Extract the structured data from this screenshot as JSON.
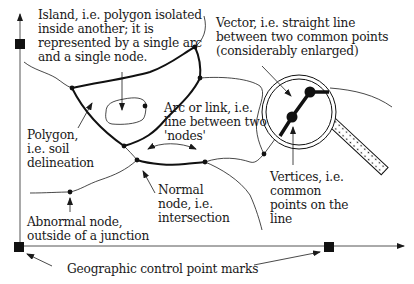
{
  "figure": {
    "labels": {
      "island": "Island, i.e. polygon isolated\ninside another; it is\nrepresented by a single arc\nand a single node.",
      "vector": "Vector, i.e. straight line\nbetween two common points\n(considerably enlarged)",
      "arc": "Arc or link, i.e.\nline between two\n'nodes'",
      "polygon": "Polygon,\ni.e. soil\ndelineation",
      "normal_node": "Normal\nnode, i.e.\nintersection",
      "abnormal_node": "Abnormal node,\noutside of a junction",
      "vertices": "Vertices, i.e.\ncommon\npoints on the\nline",
      "control_points": "Geographic control point marks"
    },
    "colors": {
      "ink": "#1a1a1a",
      "background": "#ffffff",
      "axis": "#555555"
    },
    "elements": {
      "axes": [
        "vertical-axis",
        "horizontal-axis"
      ],
      "control_point_marks": 3,
      "magnifier": "magnifying-glass"
    }
  }
}
